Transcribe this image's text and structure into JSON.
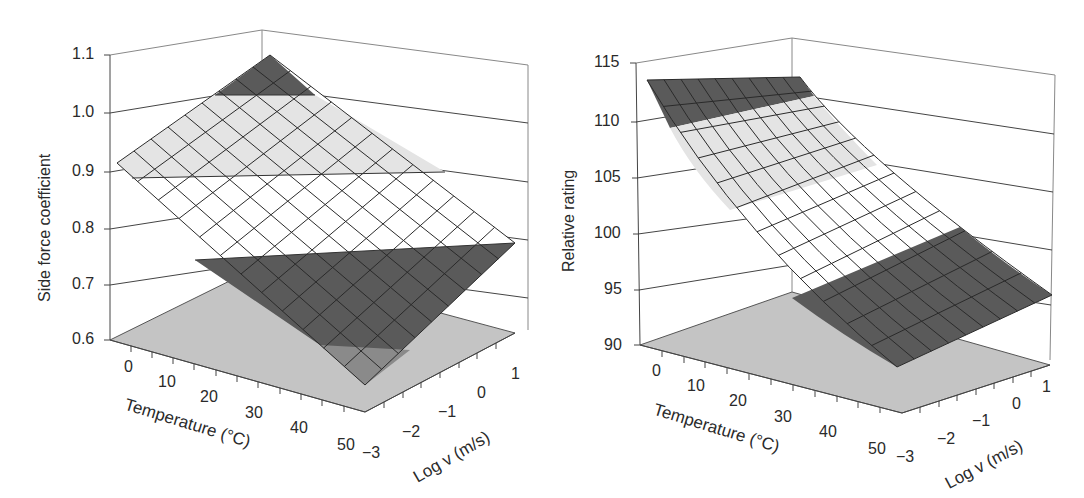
{
  "chart_data": [
    {
      "type": "surface3d",
      "title": "",
      "xlabel": "Temperature (°C)",
      "ylabel": "Log v (m/s)",
      "zlabel": "Side force coefficient",
      "x_ticks": [
        "0",
        "10",
        "20",
        "30",
        "40",
        "50"
      ],
      "y_ticks": [
        "-3",
        "-2",
        "-1",
        "0",
        "1"
      ],
      "z_ticks": [
        "0.6",
        "0.7",
        "0.8",
        "0.9",
        "1.0",
        "1.1"
      ],
      "xlim": [
        -5,
        55
      ],
      "ylim": [
        -3,
        1
      ],
      "zlim": [
        0.6,
        1.1
      ],
      "grid": true,
      "surface_description": "Planar surface; coefficient highest at low temperature and high log velocity, lowest at high temperature and low log velocity",
      "corner_values": [
        {
          "temperature": -5,
          "log_v": 1,
          "value": 1.1
        },
        {
          "temperature": -5,
          "log_v": -3,
          "value": 0.92
        },
        {
          "temperature": 55,
          "log_v": 1,
          "value": 0.78
        },
        {
          "temperature": 55,
          "log_v": -3,
          "value": 0.6
        }
      ],
      "color_bands": [
        {
          "range": [
            0.6,
            0.75
          ],
          "color": "#5a5a5a"
        },
        {
          "range": [
            0.75,
            0.9
          ],
          "color": "#ffffff"
        },
        {
          "range": [
            0.9,
            1.05
          ],
          "color": "#e4e4e4"
        },
        {
          "range": [
            1.05,
            1.1
          ],
          "color": "#5a5a5a"
        }
      ]
    },
    {
      "type": "surface3d",
      "title": "",
      "xlabel": "Temperature (°C)",
      "ylabel": "Log v (m/s)",
      "zlabel": "Relative rating",
      "x_ticks": [
        "0",
        "10",
        "20",
        "30",
        "40",
        "50"
      ],
      "y_ticks": [
        "-3",
        "-2",
        "-1",
        "0",
        "1"
      ],
      "z_ticks": [
        "90",
        "95",
        "100",
        "105",
        "110",
        "115"
      ],
      "xlim": [
        -5,
        55
      ],
      "ylim": [
        -3,
        1
      ],
      "zlim": [
        90,
        115
      ],
      "grid": true,
      "surface_description": "Curved surface; rating highest (~113) at low temperature, decreasing with temperature to ~90 at high temperature, nearly flat along log velocity",
      "corner_values": [
        {
          "temperature": -5,
          "log_v": 1,
          "value": 113.5
        },
        {
          "temperature": -5,
          "log_v": -3,
          "value": 113.5
        },
        {
          "temperature": 55,
          "log_v": 1,
          "value": 93
        },
        {
          "temperature": 55,
          "log_v": -3,
          "value": 90.5
        }
      ],
      "color_bands": [
        {
          "range": [
            90,
            97
          ],
          "color": "#5a5a5a"
        },
        {
          "range": [
            97,
            104
          ],
          "color": "#ffffff"
        },
        {
          "range": [
            104,
            111
          ],
          "color": "#e4e4e4"
        },
        {
          "range": [
            111,
            115
          ],
          "color": "#5a5a5a"
        }
      ]
    }
  ],
  "charts": {
    "left": {
      "zlabel": "Side force coefficient",
      "xlabel": "Temperature (°C)",
      "ylabel": "Log v (m/s)",
      "z_ticks": [
        "1.1",
        "1.0",
        "0.9",
        "0.8",
        "0.7",
        "0.6"
      ],
      "x_ticks": [
        "0",
        "10",
        "20",
        "30",
        "40",
        "50"
      ],
      "y_ticks": [
        "−3",
        "−2",
        "−1",
        "0",
        "1"
      ]
    },
    "right": {
      "zlabel": "Relative rating",
      "xlabel": "Temperature (°C)",
      "ylabel": "Log v (m/s)",
      "z_ticks": [
        "115",
        "110",
        "105",
        "100",
        "95",
        "90"
      ],
      "x_ticks": [
        "0",
        "10",
        "20",
        "30",
        "40",
        "50"
      ],
      "y_ticks": [
        "−3",
        "−2",
        "−1",
        "0",
        "1"
      ]
    }
  },
  "colors": {
    "dark_band": "#5a5a5a",
    "light_band": "#e4e4e4",
    "white_band": "#ffffff",
    "floor": "#c4c4c4",
    "grid_line": "#333333"
  }
}
